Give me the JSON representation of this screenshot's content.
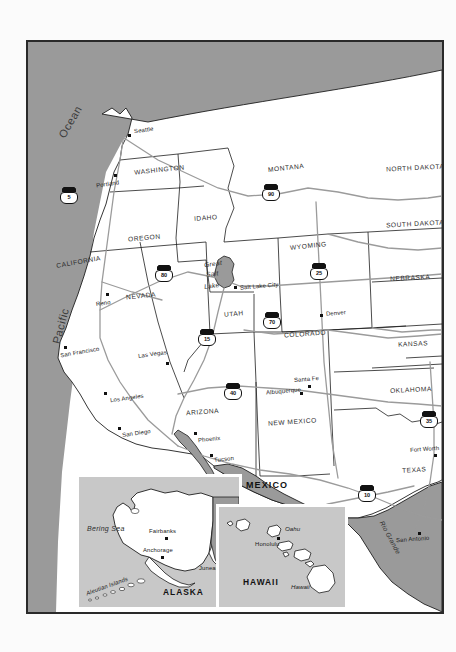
{
  "map": {
    "title": "Western United States reference map",
    "frame": {
      "border_color": "#2a2a2a"
    },
    "colors": {
      "land": "#ffffff",
      "water": "#9a9a9a",
      "inset_land": "#ffffff",
      "inset_water": "#c8c8c8",
      "road": "#9b9b9b",
      "border": "#2a2a2a",
      "text": "#1c1c1c"
    },
    "water_labels": [
      {
        "name": "pacific-ocean-label-line1",
        "text": "Ocean"
      },
      {
        "name": "pacific-ocean-label-line2",
        "text": "Pacific"
      },
      {
        "name": "bering-sea-label",
        "text": "Bering Sea"
      }
    ],
    "countries": [
      {
        "name": "mexico-label",
        "text": "MEXICO"
      }
    ],
    "states": [
      {
        "name": "washington",
        "text": "WASHINGTON"
      },
      {
        "name": "oregon",
        "text": "OREGON"
      },
      {
        "name": "idaho",
        "text": "IDAHO"
      },
      {
        "name": "montana",
        "text": "MONTANA"
      },
      {
        "name": "north-dakota",
        "text": "NORTH DAKOTA"
      },
      {
        "name": "south-dakota",
        "text": "SOUTH DAKOTA"
      },
      {
        "name": "wyoming",
        "text": "WYOMING"
      },
      {
        "name": "nebraska",
        "text": "NEBRASKA"
      },
      {
        "name": "california",
        "text": "CALIFORNIA"
      },
      {
        "name": "nevada",
        "text": "NEVADA"
      },
      {
        "name": "utah",
        "text": "UTAH"
      },
      {
        "name": "colorado",
        "text": "COLORADO"
      },
      {
        "name": "kansas",
        "text": "KANSAS"
      },
      {
        "name": "arizona",
        "text": "ARIZONA"
      },
      {
        "name": "new-mexico",
        "text": "NEW MEXICO"
      },
      {
        "name": "oklahoma",
        "text": "OKLAHOMA"
      },
      {
        "name": "texas",
        "text": "TEXAS"
      }
    ],
    "cities": [
      {
        "name": "seattle",
        "text": "Seattle"
      },
      {
        "name": "portland",
        "text": "Portland"
      },
      {
        "name": "reno",
        "text": "Reno"
      },
      {
        "name": "san-francisco",
        "text": "San Francisco"
      },
      {
        "name": "las-vegas",
        "text": "Las Vegas"
      },
      {
        "name": "los-angeles",
        "text": "Los Angeles"
      },
      {
        "name": "san-diego",
        "text": "San Diego"
      },
      {
        "name": "phoenix",
        "text": "Phoenix"
      },
      {
        "name": "tucson",
        "text": "Tucson"
      },
      {
        "name": "salt-lake-city",
        "text": "Salt Lake City"
      },
      {
        "name": "denver",
        "text": "Denver"
      },
      {
        "name": "albuquerque",
        "text": "Albuquerque"
      },
      {
        "name": "santa-fe",
        "text": "Santa Fe"
      },
      {
        "name": "fort-worth",
        "text": "Fort Worth"
      },
      {
        "name": "san-antonio",
        "text": "San Antonio"
      }
    ],
    "features": [
      {
        "name": "great-salt-lake-line1",
        "text": "Great"
      },
      {
        "name": "great-salt-lake-line2",
        "text": "Salt"
      },
      {
        "name": "great-salt-lake-line3",
        "text": "Lake"
      },
      {
        "name": "rio-grande-label",
        "text": "Rio Grande"
      }
    ],
    "interstates": [
      {
        "name": "interstate-5",
        "number": "5"
      },
      {
        "name": "interstate-90",
        "number": "90"
      },
      {
        "name": "interstate-80",
        "number": "80"
      },
      {
        "name": "interstate-25",
        "number": "25"
      },
      {
        "name": "interstate-15",
        "number": "15"
      },
      {
        "name": "interstate-70",
        "number": "70"
      },
      {
        "name": "interstate-40",
        "number": "40"
      },
      {
        "name": "interstate-35",
        "number": "35"
      },
      {
        "name": "interstate-10",
        "number": "10"
      }
    ],
    "insets": {
      "alaska": {
        "title": "ALASKA",
        "water_label": "Bering Sea",
        "cities": [
          {
            "name": "fairbanks",
            "text": "Fairbanks"
          },
          {
            "name": "anchorage",
            "text": "Anchorage"
          },
          {
            "name": "juneau",
            "text": "Juneau"
          }
        ],
        "features": [
          {
            "name": "aleutian-islands",
            "text": "Aleutian Islands"
          }
        ]
      },
      "hawaii": {
        "title": "HAWAII",
        "cities": [
          {
            "name": "honolulu",
            "text": "Honolulu"
          }
        ],
        "islands": [
          {
            "name": "oahu",
            "text": "Oahu"
          },
          {
            "name": "hawaii-island",
            "text": "Hawaii"
          }
        ]
      }
    }
  }
}
